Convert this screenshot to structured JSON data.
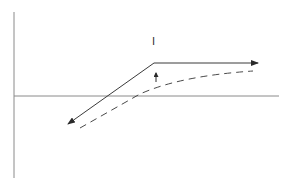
{
  "diagram": {
    "type": "kinked line with shifted dashed curve",
    "colors": {
      "background": "#ffffff",
      "axis": "#8a8a8a",
      "line": "#3a3a3a",
      "dashed": "#4a4a4a"
    },
    "axes": {
      "vertical": {
        "x": 14,
        "y1": 12,
        "y2": 178
      },
      "horizontal": {
        "y": 96,
        "x1": 14,
        "x2": 279
      }
    },
    "solid_line": {
      "points": [
        [
          68,
          124
        ],
        [
          154,
          63
        ],
        [
          258,
          63
        ]
      ],
      "arrow_ends": [
        "start",
        "end"
      ]
    },
    "dashed_curve": {
      "path": "M80,128 L140,94 Q180,76 253,71"
    },
    "shift_arrow": {
      "x": 156,
      "y_from": 82,
      "y_to": 73,
      "direction": "up"
    },
    "labels": [
      {
        "id": "label-I",
        "text": "I",
        "x": 154,
        "y": 40
      }
    ]
  }
}
